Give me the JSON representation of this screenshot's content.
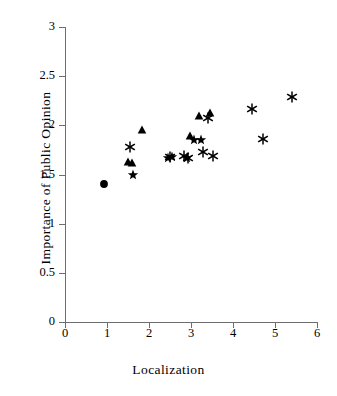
{
  "chart_data": {
    "type": "scatter",
    "title": "",
    "xlabel": "Localization",
    "ylabel": "Importance of Public Opinion",
    "xlim": [
      0,
      6
    ],
    "ylim": [
      0,
      3
    ],
    "xticks": [
      "0",
      "1",
      "2",
      "3",
      "4",
      "5",
      "6"
    ],
    "yticks": [
      "0",
      "0.5",
      "1",
      "1.5",
      "2",
      "2.5",
      "3"
    ],
    "xtick_values": [
      0,
      1,
      2,
      3,
      4,
      5,
      6
    ],
    "ytick_values": [
      0,
      0.5,
      1,
      1.5,
      2,
      2.5,
      3
    ],
    "grid": false,
    "legend": "none",
    "marker_color": "#000000",
    "axis_color": "#6e6e6e",
    "series": [
      {
        "name": "circle",
        "marker": "filled-circle",
        "points": [
          {
            "x": 0.92,
            "y": 1.4
          }
        ]
      },
      {
        "name": "triangle",
        "marker": "filled-triangle",
        "points": [
          {
            "x": 1.5,
            "y": 1.63
          },
          {
            "x": 1.6,
            "y": 1.62
          },
          {
            "x": 1.83,
            "y": 1.955
          },
          {
            "x": 2.97,
            "y": 1.895
          },
          {
            "x": 3.18,
            "y": 2.1
          },
          {
            "x": 3.46,
            "y": 2.13
          }
        ]
      },
      {
        "name": "star",
        "marker": "five-point-star",
        "points": [
          {
            "x": 1.62,
            "y": 1.5
          },
          {
            "x": 2.46,
            "y": 1.665
          },
          {
            "x": 2.54,
            "y": 1.68
          },
          {
            "x": 2.9,
            "y": 1.665
          },
          {
            "x": 3.06,
            "y": 1.85
          },
          {
            "x": 3.23,
            "y": 1.855
          }
        ]
      },
      {
        "name": "asterisk",
        "marker": "six-spoke-asterisk",
        "points": [
          {
            "x": 1.55,
            "y": 1.78
          },
          {
            "x": 2.5,
            "y": 1.68
          },
          {
            "x": 2.84,
            "y": 1.685
          },
          {
            "x": 2.93,
            "y": 1.67
          },
          {
            "x": 3.29,
            "y": 1.73
          },
          {
            "x": 3.41,
            "y": 2.07
          },
          {
            "x": 3.52,
            "y": 1.69
          },
          {
            "x": 4.45,
            "y": 2.165
          },
          {
            "x": 4.71,
            "y": 1.86
          },
          {
            "x": 5.41,
            "y": 2.29
          }
        ]
      }
    ]
  }
}
